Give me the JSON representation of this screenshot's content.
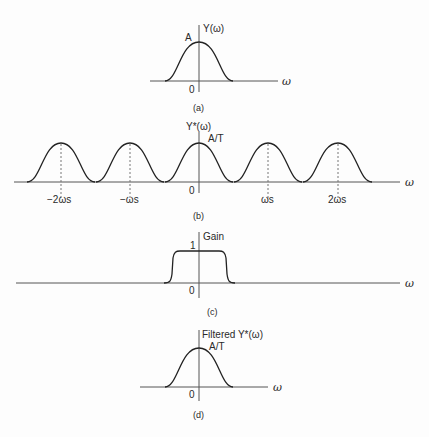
{
  "panels": {
    "a": {
      "caption": "(a)",
      "y_label": "Y(ω)",
      "peak_label": "A",
      "origin_label": "0",
      "x_label": "ω"
    },
    "b": {
      "caption": "(b)",
      "y_label": "Y*(ω)",
      "peak_label": "A/T",
      "origin_label": "0",
      "x_label": "ω",
      "ticks": [
        "−2ωs",
        "−ωs",
        "ωs",
        "2ωs"
      ]
    },
    "c": {
      "caption": "(c)",
      "y_label": "Gain",
      "level_label": "1",
      "origin_label": "0",
      "x_label": "ω"
    },
    "d": {
      "caption": "(d)",
      "y_label": "Filtered Y*(ω)",
      "peak_label": "A/T",
      "origin_label": "0",
      "x_label": "ω"
    }
  },
  "colors": {
    "line": "#222222",
    "axis": "#555555",
    "background": "#fdfdfd"
  }
}
